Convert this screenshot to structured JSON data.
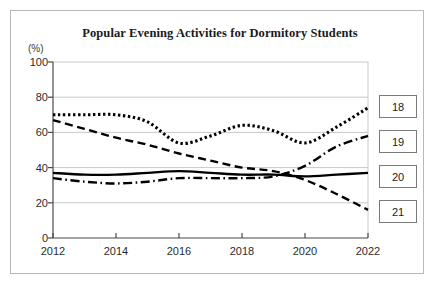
{
  "chart_data": {
    "type": "line",
    "title": "Popular Evening Activities for Dormitory Students",
    "xlabel": "",
    "ylabel": "(%)",
    "yunit": "(%)",
    "xlim": [
      2012,
      2022
    ],
    "ylim": [
      0,
      100
    ],
    "grid": true,
    "legend_position": "right-outside",
    "x": [
      2012,
      2013,
      2014,
      2015,
      2016,
      2017,
      2018,
      2019,
      2020,
      2021,
      2022
    ],
    "x_ticks": [
      "2012",
      "2014",
      "2016",
      "2018",
      "2020",
      "2022"
    ],
    "y_ticks": [
      "0",
      "20",
      "40",
      "60",
      "80",
      "100"
    ],
    "series": [
      {
        "name": "18",
        "style": "dotted",
        "color": "#000000",
        "values": [
          70,
          70,
          70,
          66,
          54,
          58,
          64,
          61,
          54,
          63,
          74
        ]
      },
      {
        "name": "19",
        "style": "dashdot",
        "color": "#000000",
        "values": [
          34,
          32,
          31,
          32,
          34,
          34,
          34,
          35,
          41,
          52,
          58
        ]
      },
      {
        "name": "20",
        "style": "solid",
        "color": "#000000",
        "values": [
          37,
          36,
          36,
          37,
          38,
          37,
          36,
          36,
          35,
          36,
          37
        ]
      },
      {
        "name": "21",
        "style": "dashed",
        "color": "#000000",
        "values": [
          67,
          62,
          57,
          53,
          48,
          44,
          40,
          38,
          33,
          25,
          16
        ]
      }
    ]
  },
  "legend": {
    "items": [
      {
        "label": "18"
      },
      {
        "label": "19"
      },
      {
        "label": "20"
      },
      {
        "label": "21"
      }
    ]
  },
  "axes": {
    "y_labels": [
      "100",
      "80",
      "60",
      "40",
      "20",
      "0"
    ],
    "x_labels": [
      "2012",
      "2014",
      "2016",
      "2018",
      "2020",
      "2022"
    ]
  }
}
